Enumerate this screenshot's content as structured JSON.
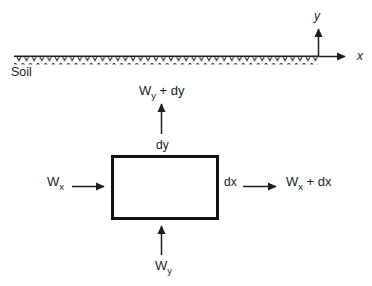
{
  "diagram": {
    "background_color": "#ffffff",
    "line_color": "#1d1d1d",
    "axes": {
      "y_label": "y",
      "x_label": "x",
      "origin_x": 318,
      "origin_y": 57
    },
    "soil": {
      "label": "Soil",
      "surface_line_y": 56,
      "surface_line_x_start": 14,
      "surface_line_x_end": 318,
      "hatch_style": "chevron"
    },
    "control_volume": {
      "name": "control-volume-rectangle",
      "left": 111,
      "top": 155,
      "right": 218,
      "bottom": 219,
      "stroke_width": 3
    },
    "fluxes": {
      "inflow_x": {
        "label_main": "W",
        "label_sub": "x",
        "direction": "right"
      },
      "outflow_x": {
        "label_main": "W",
        "label_sub": "x",
        "label_tail": " + dx",
        "direction": "right"
      },
      "inflow_y": {
        "label_main": "W",
        "label_sub": "y",
        "direction": "up"
      },
      "outflow_y": {
        "label_main": "W",
        "label_sub": "y",
        "label_tail": " + dy",
        "direction": "up"
      }
    },
    "dimensions": {
      "width_label": "dx",
      "height_label": "dy"
    }
  }
}
